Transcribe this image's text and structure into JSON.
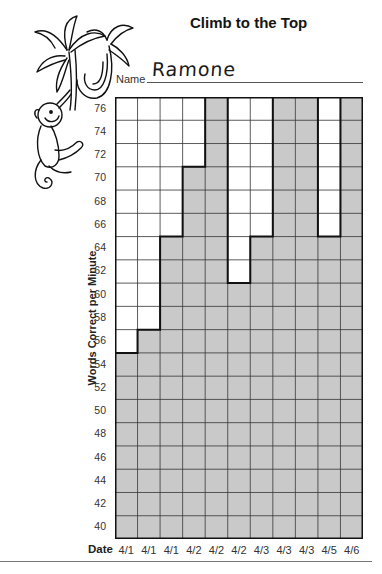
{
  "title": "Climb to the Top",
  "name_label": "Name",
  "name_value": "Ramone",
  "colors": {
    "fill": "#c9c9c9",
    "grid_line": "#333333",
    "bar_outline": "#111111",
    "background": "#ffffff"
  },
  "chart_data": {
    "type": "bar",
    "title": "Climb to the Top",
    "xlabel": "Date",
    "ylabel": "Words Correct per Minute",
    "categories": [
      "4/1",
      "4/1",
      "4/1",
      "4/2",
      "4/2",
      "4/2",
      "4/3",
      "4/3",
      "4/3",
      "4/5",
      "4/6"
    ],
    "values": [
      54,
      56,
      64,
      70,
      76,
      60,
      64,
      76,
      76,
      64,
      76
    ],
    "y_ticks": [
      76,
      74,
      72,
      70,
      68,
      66,
      64,
      62,
      60,
      58,
      56,
      54,
      52,
      50,
      48,
      46,
      44,
      42,
      40
    ],
    "ylim": [
      40,
      76
    ],
    "grid": true,
    "legend": "none"
  },
  "y_axis_title": "Words Correct per Minute",
  "x_axis_title": "Date"
}
